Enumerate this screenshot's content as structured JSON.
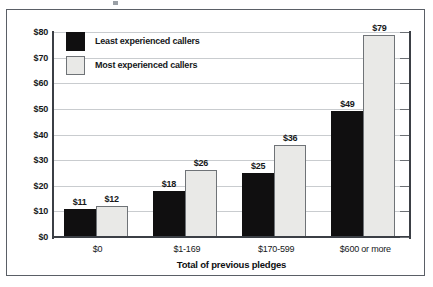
{
  "chart_data": {
    "type": "bar",
    "title": "",
    "xlabel": "Total of previous pledges",
    "ylabel": "",
    "categories": [
      "$0",
      "$1-169",
      "$170-599",
      "$600 or more"
    ],
    "series": [
      {
        "name": "Least experienced callers",
        "color": "#100f10",
        "values": [
          11,
          18,
          25,
          49
        ],
        "labels": [
          "$11",
          "$18",
          "$25",
          "$49"
        ]
      },
      {
        "name": "Most experienced callers",
        "color": "#e9e9e7",
        "values": [
          12,
          26,
          36,
          79
        ],
        "labels": [
          "$12",
          "$26",
          "$36",
          "$79"
        ]
      }
    ],
    "ylim": [
      0,
      80
    ],
    "yticks": [
      0,
      10,
      20,
      30,
      40,
      50,
      60,
      70,
      80
    ],
    "ytick_labels": [
      "$0",
      "$10",
      "$20",
      "$30",
      "$40",
      "$50",
      "$60",
      "$70",
      "$80"
    ],
    "grid": true,
    "legend_position": "top-left"
  },
  "legend": {
    "items": [
      {
        "label": "Least experienced callers",
        "swatch": "dark"
      },
      {
        "label": "Most experienced callers",
        "swatch": "light"
      }
    ]
  },
  "axes": {
    "x_title": "Total of previous pledges"
  }
}
